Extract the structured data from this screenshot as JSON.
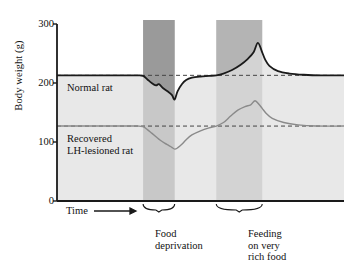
{
  "figure": {
    "ylabel": "Body weight (g)",
    "xlabel": "Time",
    "y_ticks": [
      "300",
      "200",
      "100",
      "0"
    ],
    "series_labels": {
      "normal": "Normal rat",
      "lesioned": "Recovered\nLH-lesioned rat"
    },
    "band_labels": {
      "deprivation": "Food\ndeprivation",
      "rich_food": "Feeding\non very\nrich food"
    },
    "colors": {
      "normal_line": "#1a1a1a",
      "lesioned_line": "#8a8a8a",
      "normal_fill": "#e8e8e8",
      "lesioned_fill": "#d8d8d8",
      "band_deprivation": "#9a9a9a",
      "band_rich": "#b4b4b4",
      "axis": "#1a1a1a",
      "dashed": "#444444"
    }
  },
  "chart_data": {
    "type": "line",
    "title": "",
    "xlabel": "Time",
    "ylabel": "Body weight (g)",
    "ylim": [
      0,
      300
    ],
    "yticks": [
      0,
      100,
      200,
      300
    ],
    "grid": false,
    "legend": "inline-annotations",
    "baselines": {
      "normal": 213,
      "lesioned": 127
    },
    "shaded_bands": [
      {
        "name": "Food deprivation",
        "x_start": 0.3,
        "x_end": 0.41
      },
      {
        "name": "Feeding on very rich food",
        "x_start": 0.555,
        "x_end": 0.715
      }
    ],
    "series": [
      {
        "name": "Normal rat",
        "color": "#1a1a1a",
        "x": [
          0.0,
          0.1,
          0.2,
          0.28,
          0.3,
          0.315,
          0.33,
          0.345,
          0.355,
          0.37,
          0.385,
          0.4,
          0.41,
          0.42,
          0.435,
          0.45,
          0.47,
          0.5,
          0.53,
          0.555,
          0.58,
          0.61,
          0.64,
          0.665,
          0.685,
          0.7,
          0.715,
          0.725,
          0.74,
          0.77,
          0.81,
          0.86,
          0.92,
          1.0
        ],
        "y": [
          213,
          213,
          213,
          213,
          212,
          206,
          200,
          196,
          198,
          191,
          186,
          180,
          172,
          186,
          198,
          205,
          209,
          211,
          212,
          213,
          216,
          222,
          231,
          241,
          252,
          268,
          252,
          240,
          229,
          220,
          216,
          214,
          213,
          213
        ]
      },
      {
        "name": "Recovered LH-lesioned rat",
        "color": "#8a8a8a",
        "x": [
          0.0,
          0.1,
          0.2,
          0.28,
          0.3,
          0.315,
          0.33,
          0.345,
          0.36,
          0.375,
          0.39,
          0.4,
          0.41,
          0.42,
          0.435,
          0.45,
          0.47,
          0.5,
          0.53,
          0.555,
          0.58,
          0.605,
          0.63,
          0.655,
          0.675,
          0.69,
          0.705,
          0.715,
          0.73,
          0.75,
          0.79,
          0.84,
          0.9,
          1.0
        ],
        "y": [
          127,
          127,
          127,
          127,
          126,
          121,
          115,
          109,
          103,
          98,
          94,
          91,
          88,
          90,
          96,
          104,
          112,
          119,
          124,
          127,
          133,
          144,
          154,
          160,
          163,
          170,
          163,
          157,
          148,
          140,
          133,
          129,
          127,
          127
        ]
      }
    ]
  }
}
